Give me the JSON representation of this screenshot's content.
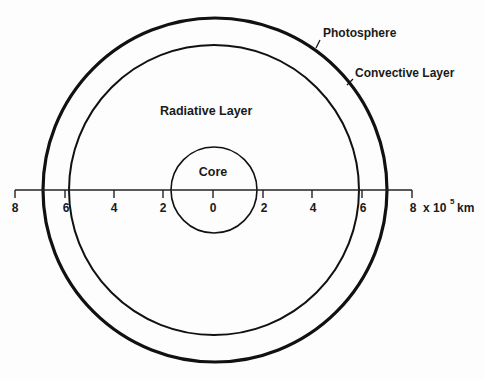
{
  "diagram": {
    "title": "",
    "labels": {
      "photosphere": "Photosphere",
      "convective": "Convective Layer",
      "radiative": "Radiative Layer",
      "core": "Core"
    },
    "axis": {
      "ticks": [
        "8",
        "6",
        "4",
        "2",
        "0",
        "2",
        "4",
        "6",
        "8"
      ],
      "unit_prefix": "x 10",
      "unit_exp": "5",
      "unit": "km"
    },
    "layers": [
      {
        "name": "Core",
        "radius_1e5km": 1.7
      },
      {
        "name": "Radiative Layer",
        "radius_1e5km": 5.9
      },
      {
        "name": "Convective Layer",
        "radius_1e5km": 6.96
      },
      {
        "name": "Photosphere",
        "radius_1e5km": 6.96
      }
    ],
    "colors": {
      "line": "#111111",
      "background": "#fdfdfd"
    }
  }
}
